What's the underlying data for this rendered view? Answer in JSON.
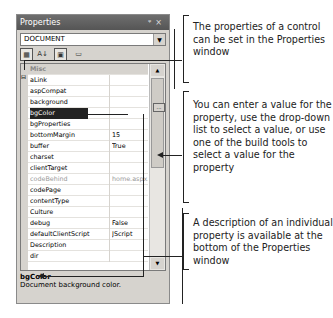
{
  "window": {
    "title": "Properties",
    "pin_glyph": "📌",
    "close_glyph": "×",
    "object_selector": "DOCUMENT",
    "toolbar": [
      {
        "name": "categorized-icon",
        "glyph": "▦",
        "pressed": true
      },
      {
        "name": "alphabetical-icon",
        "glyph": "A↓",
        "pressed": false
      },
      {
        "name": "properties-icon",
        "glyph": "▣",
        "pressed": true
      },
      {
        "name": "property-pages-icon",
        "glyph": "▭",
        "pressed": false
      }
    ]
  },
  "grid": {
    "category": "Misc",
    "rows": [
      {
        "name": "aLink",
        "value": ""
      },
      {
        "name": "aspCompat",
        "value": ""
      },
      {
        "name": "background",
        "value": ""
      },
      {
        "name": "bgColor",
        "value": ""
      },
      {
        "name": "bgProperties",
        "value": ""
      },
      {
        "name": "bottomMargin",
        "value": "15"
      },
      {
        "name": "buffer",
        "value": "True"
      },
      {
        "name": "charset",
        "value": ""
      },
      {
        "name": "clientTarget",
        "value": ""
      },
      {
        "name": "codeBehind",
        "value": "home.aspx.vb"
      },
      {
        "name": "codePage",
        "value": ""
      },
      {
        "name": "contentType",
        "value": ""
      },
      {
        "name": "Culture",
        "value": ""
      },
      {
        "name": "debug",
        "value": "False"
      },
      {
        "name": "defaultClientScript",
        "value": "JScript"
      },
      {
        "name": "Description",
        "value": ""
      },
      {
        "name": "dir",
        "value": ""
      }
    ],
    "build_button": "..."
  },
  "description": {
    "title": "bgColor",
    "text": "Document background color."
  },
  "callouts": [
    "The properties of a control can be set in the Properties window",
    "You can enter a value for the property, use the drop-down list to select a value, or use one of the build tools to select a value for the property",
    "A description of an individual property is available at the bottom of the Properties window"
  ]
}
